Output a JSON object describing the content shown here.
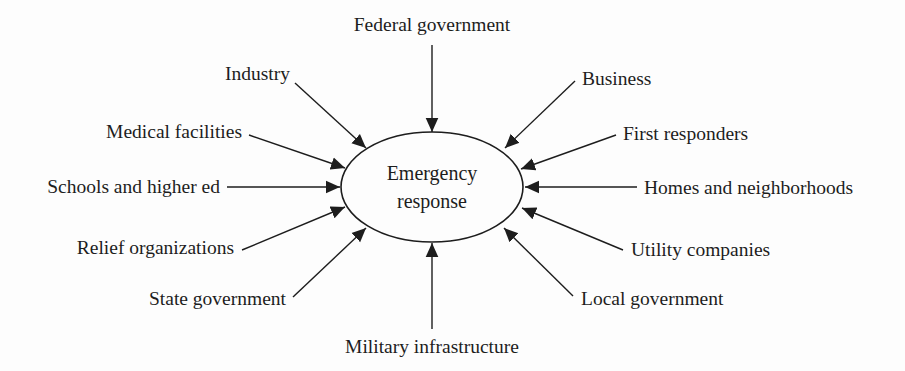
{
  "diagram": {
    "type": "hub-and-spoke",
    "center": {
      "label_line1": "Emergency",
      "label_line2": "response"
    },
    "nodes": [
      {
        "id": "federal",
        "label": "Federal government"
      },
      {
        "id": "industry",
        "label": "Industry"
      },
      {
        "id": "business",
        "label": "Business"
      },
      {
        "id": "medical",
        "label": "Medical facilities"
      },
      {
        "id": "first",
        "label": "First responders"
      },
      {
        "id": "schools",
        "label": "Schools and higher ed"
      },
      {
        "id": "homes",
        "label": "Homes and neighborhoods"
      },
      {
        "id": "relief",
        "label": "Relief organizations"
      },
      {
        "id": "utility",
        "label": "Utility companies"
      },
      {
        "id": "state",
        "label": "State government"
      },
      {
        "id": "local",
        "label": "Local government"
      },
      {
        "id": "military",
        "label": "Military infrastructure"
      }
    ],
    "edges_direction": "all nodes point to center",
    "colors": {
      "stroke": "#1d1d1d",
      "background": "#fdfdfd"
    }
  }
}
